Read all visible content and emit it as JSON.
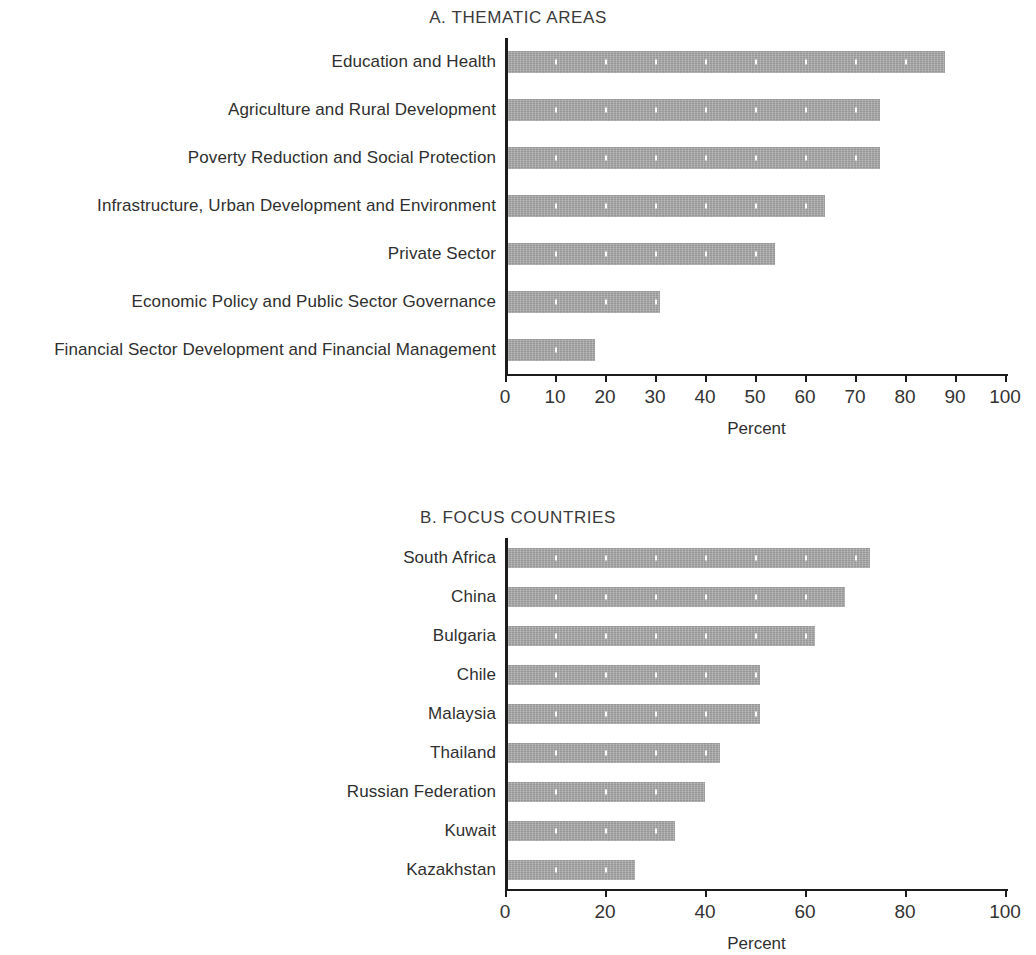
{
  "chart_data": [
    {
      "type": "bar",
      "orientation": "horizontal",
      "title": "A. THEMATIC AREAS",
      "xlabel": "Percent",
      "ylabel": "",
      "xlim": [
        0,
        100
      ],
      "xticks": [
        0,
        10,
        20,
        30,
        40,
        50,
        60,
        70,
        80,
        90,
        100
      ],
      "grid": false,
      "legend": "none",
      "bar_color": "#a8a8a8",
      "categories": [
        "Education and Health",
        "Agriculture and Rural Development",
        "Poverty Reduction and Social Protection",
        "Infrastructure, Urban Development and Environment",
        "Private Sector",
        "Economic Policy and Public Sector Governance",
        "Financial Sector Development and Financial Management"
      ],
      "values": [
        88,
        75,
        75,
        64,
        54,
        31,
        18
      ]
    },
    {
      "type": "bar",
      "orientation": "horizontal",
      "title": "B. FOCUS COUNTRIES",
      "xlabel": "Percent",
      "ylabel": "",
      "xlim": [
        0,
        100
      ],
      "xticks": [
        0,
        20,
        40,
        60,
        80,
        100
      ],
      "grid": false,
      "legend": "none",
      "bar_color": "#a8a8a8",
      "categories": [
        "South Africa",
        "China",
        "Bulgaria",
        "Chile",
        "Malaysia",
        "Thailand",
        "Russian Federation",
        "Kuwait",
        "Kazakhstan"
      ],
      "values": [
        73,
        68,
        62,
        51,
        51,
        43,
        40,
        34,
        26
      ]
    }
  ]
}
